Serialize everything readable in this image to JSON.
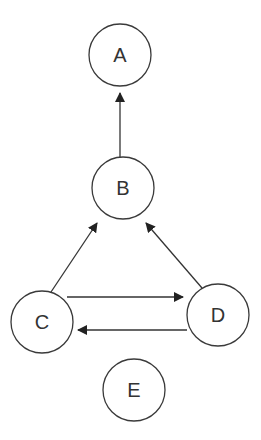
{
  "diagram": {
    "type": "directed-graph",
    "nodes": [
      {
        "id": "A",
        "label": "A",
        "cx": 120,
        "cy": 55,
        "r": 31
      },
      {
        "id": "B",
        "label": "B",
        "cx": 123,
        "cy": 188,
        "r": 31
      },
      {
        "id": "C",
        "label": "C",
        "cx": 42,
        "cy": 322,
        "r": 31
      },
      {
        "id": "D",
        "label": "D",
        "cx": 218,
        "cy": 315,
        "r": 31
      },
      {
        "id": "E",
        "label": "E",
        "cx": 134,
        "cy": 390,
        "r": 31
      }
    ],
    "edges": [
      {
        "from": "B",
        "to": "A",
        "x1": 120,
        "y1": 157,
        "x2": 120,
        "y2": 93
      },
      {
        "from": "C",
        "to": "B",
        "x1": 51,
        "y1": 292,
        "x2": 97,
        "y2": 223
      },
      {
        "from": "D",
        "to": "B",
        "x1": 202,
        "y1": 288,
        "x2": 146,
        "y2": 223
      },
      {
        "from": "C",
        "to": "D",
        "x1": 67,
        "y1": 297,
        "x2": 183,
        "y2": 297
      },
      {
        "from": "D",
        "to": "C",
        "x1": 187,
        "y1": 330,
        "x2": 78,
        "y2": 330
      }
    ],
    "colors": {
      "stroke": "#333333",
      "fill": "#ffffff"
    }
  }
}
